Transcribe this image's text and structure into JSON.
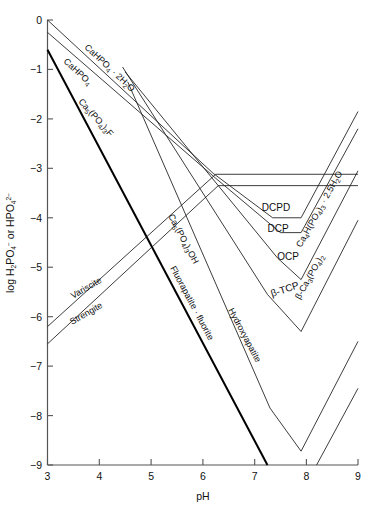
{
  "chart_data": {
    "type": "line",
    "title": "",
    "xlabel": "pH",
    "ylabel": "log H2PO4- or HPO4 2-",
    "ylabel_parts": {
      "lead": "log H",
      "sub1": "2",
      "mid": "PO",
      "sub2": "4",
      "sup1": "−",
      "conj": " or HPO",
      "sub3": "4",
      "sup2": "2−"
    },
    "xlim": [
      3,
      9
    ],
    "ylim": [
      -9,
      0
    ],
    "xticks": [
      "3",
      "4",
      "5",
      "6",
      "7",
      "8",
      "9"
    ],
    "yticks": [
      "0",
      "−1",
      "−2",
      "−3",
      "−4",
      "−5",
      "−6",
      "−7",
      "−8",
      "−9"
    ],
    "grid": false,
    "legend_position": "inline-labels",
    "series": [
      {
        "name": "CaHPO4 . 2H2O",
        "label": "CaHPO₄ · 2H₂O",
        "style": "thin",
        "points": [
          [
            3,
            0.0
          ],
          [
            6.2,
            -3.1
          ],
          [
            7.35,
            -4.0
          ],
          [
            7.9,
            -4.0
          ],
          [
            9,
            -1.85
          ]
        ]
      },
      {
        "name": "CaHPO4",
        "label": "CaHPO₄",
        "style": "thin",
        "points": [
          [
            3,
            -0.25
          ],
          [
            6.25,
            -3.2
          ],
          [
            7.5,
            -4.3
          ],
          [
            7.9,
            -4.3
          ],
          [
            9,
            -2.2
          ]
        ]
      },
      {
        "name": "Ca5(PO4)3F",
        "label": "Ca₅(PO₄)₃F",
        "style": "bold",
        "points": [
          [
            3,
            -0.6
          ],
          [
            7.25,
            -9.0
          ]
        ]
      },
      {
        "name": "Ca5(PO4)3OH",
        "label": "Ca₅(PO₄)₃OH",
        "style": "thin",
        "points": [
          [
            4.55,
            -1.25
          ],
          [
            7.3,
            -7.85
          ],
          [
            7.9,
            -8.72
          ],
          [
            9,
            -6.5
          ]
        ]
      },
      {
        "name": "Variscite",
        "label": "Variscite",
        "style": "thin",
        "points": [
          [
            3,
            -6.2
          ],
          [
            6.25,
            -3.12
          ],
          [
            9,
            -3.12
          ]
        ]
      },
      {
        "name": "Strengite",
        "label": "Strengite",
        "style": "thin",
        "points": [
          [
            3,
            -6.55
          ],
          [
            6.3,
            -3.35
          ],
          [
            9,
            -3.35
          ]
        ]
      },
      {
        "name": "OCP",
        "label": "OCP",
        "style": "thin",
        "points": [
          [
            4.5,
            -1.05
          ],
          [
            7.45,
            -4.82
          ],
          [
            7.9,
            -5.25
          ],
          [
            9,
            -3.05
          ]
        ]
      },
      {
        "name": "beta-TCP",
        "label": "β-TCP",
        "style": "thin",
        "points": [
          [
            4.45,
            -0.95
          ],
          [
            7.25,
            -5.55
          ],
          [
            7.9,
            -6.3
          ],
          [
            9,
            -4.05
          ]
        ]
      },
      {
        "name": "lower-right-branch",
        "label": "",
        "style": "thin",
        "points": [
          [
            8.2,
            -9.0
          ],
          [
            9,
            -7.45
          ]
        ]
      }
    ],
    "annotations": [
      {
        "id": "dcpd-label",
        "text": "DCPD"
      },
      {
        "id": "dcp-label",
        "text": "DCP"
      },
      {
        "id": "ocp-label",
        "text": "OCP"
      },
      {
        "id": "btcp-label",
        "text": "β-TCP"
      },
      {
        "id": "ca4h-label",
        "text": "Ca₄H(PO₄)₃ · 2.5H₂O"
      },
      {
        "id": "bca3-label",
        "text": "β-Ca₃(PO₄)₂"
      },
      {
        "id": "cahpo4-2h2o-label",
        "text": "CaHPO₄ · 2H₂O"
      },
      {
        "id": "cahpo4-label",
        "text": "CaHPO₄"
      },
      {
        "id": "ca5po43f-label",
        "text": "Ca₅(PO₄)₃F"
      },
      {
        "id": "ca5po43oh-label",
        "text": "Ca₅(PO₄)₃OH"
      },
      {
        "id": "variscite-label",
        "text": "Variscite"
      },
      {
        "id": "strengite-label",
        "text": "Strengite"
      },
      {
        "id": "fluorapatite-label",
        "text": "Fluorapatite · fluorite"
      },
      {
        "id": "hydroxyapatite-label",
        "text": "Hydroxyapatite"
      }
    ]
  },
  "axes": {
    "x_title": "pH",
    "xticks": [
      "3",
      "4",
      "5",
      "6",
      "7",
      "8",
      "9"
    ],
    "yticks": [
      "0",
      "−1",
      "−2",
      "−3",
      "−4",
      "−5",
      "−6",
      "−7",
      "−8",
      "−9"
    ]
  },
  "labels": {
    "dcpd": "DCPD",
    "dcp": "DCP",
    "ocp": "OCP",
    "btcp": "β-TCP",
    "ca4h": "Ca₄H(PO₄)₃ · 2.5H₂O",
    "bca3": "β-Ca₃(PO₄)₂",
    "cahpo4_2h2o": "CaHPO₄ · 2H₂O",
    "cahpo4": "CaHPO₄",
    "ca5po43f": "Ca₅(PO₄)₃F",
    "ca5po43oh": "Ca₅(PO₄)₃OH",
    "variscite": "Variscite",
    "strengite": "Strengite",
    "fluorapatite": "Fluorapatite · fluorite",
    "hydroxyapatite": "Hydroxyapatite"
  },
  "colors": {
    "background": "#ffffff",
    "axis": "#555555",
    "curve": "#1a1a1a",
    "curve_bold": "#000000",
    "text": "#111111"
  }
}
